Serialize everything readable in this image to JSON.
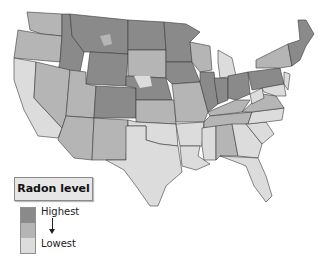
{
  "legend": {
    "title": "Radon level",
    "high_label": "Highest",
    "low_label": "Lowest",
    "levels": [
      {
        "name": "highest",
        "color": "#8a8a8a"
      },
      {
        "name": "moderate",
        "color": "#b5b5b5"
      },
      {
        "name": "lowest",
        "color": "#dcdcdc"
      }
    ],
    "arrow_icon": "arrow-down-icon"
  },
  "colors": {
    "high": "#8a8a8a",
    "mid": "#b5b5b5",
    "low": "#dcdcdc",
    "border": "#3a3a3a",
    "water": "#ffffff"
  }
}
